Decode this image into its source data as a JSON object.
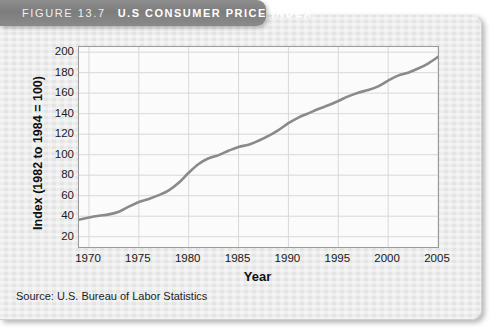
{
  "figure": {
    "label": "FIGURE 13.7",
    "title": "U.S CONSUMER PRICE INDEX",
    "source": "Source: U.S. Bureau of Labor Statistics",
    "card_bg": "#e9e9e9",
    "tab_bg": "#7d7d7d",
    "plot_bg": "#fbfbfb",
    "line_color": "#8a8a8a",
    "grid_color": "#d8d8d8",
    "frame_color": "#9a9a9a"
  },
  "chart_data": {
    "type": "line",
    "title": "U.S Consumer Price Index",
    "xlabel": "Year",
    "ylabel": "Index (1982 to 1984 = 100)",
    "xlim": [
      1969,
      2005
    ],
    "ylim": [
      10,
      205
    ],
    "yticks": [
      200,
      180,
      160,
      140,
      120,
      100,
      80,
      60,
      40,
      20
    ],
    "xticks": [
      1970,
      1975,
      1980,
      1985,
      1990,
      1995,
      2000,
      2005
    ],
    "grid": true,
    "legend": "none",
    "series": [
      {
        "name": "Consumer Price Index",
        "x": [
          1969,
          1970,
          1971,
          1972,
          1973,
          1974,
          1975,
          1976,
          1977,
          1978,
          1979,
          1980,
          1981,
          1982,
          1983,
          1984,
          1985,
          1986,
          1987,
          1988,
          1989,
          1990,
          1991,
          1992,
          1993,
          1994,
          1995,
          1996,
          1997,
          1998,
          1999,
          2000,
          2001,
          2002,
          2003,
          2004,
          2005
        ],
        "values": [
          36.7,
          38.8,
          40.5,
          41.8,
          44.4,
          49.3,
          53.8,
          56.9,
          60.6,
          65.2,
          72.6,
          82.4,
          90.9,
          96.5,
          99.6,
          103.9,
          107.6,
          109.6,
          113.6,
          118.3,
          124.0,
          130.7,
          136.2,
          140.3,
          144.5,
          148.2,
          152.4,
          156.9,
          160.5,
          163.0,
          166.6,
          172.2,
          177.1,
          179.9,
          184.0,
          188.9,
          195.3
        ]
      }
    ]
  }
}
